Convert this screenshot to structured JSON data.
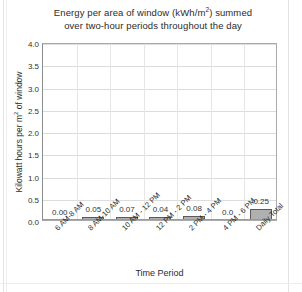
{
  "chart_data": {
    "type": "bar",
    "title_line1": "Energy per area of window (kWh/m",
    "title_sup": "2",
    "title_line1_end": ") summed",
    "title_line2": "over two-hour periods throughout the day",
    "title": "Energy per area of window (kWh/m2) summed over two-hour periods throughout the day",
    "xlabel": "Time Period",
    "ylabel_pre": "Kilowatt hours per m",
    "ylabel_sup": "2",
    "ylabel_post": " of window",
    "ylabel": "Kilowatt hours per m2 of window",
    "categories": [
      "6 AM-8 AM",
      "8 AM-10 AM",
      "10 AM - 12 PM",
      "12 PM - 2 PM",
      "2 PM - 4 PM",
      "4 PM - 6 PM",
      "Daily Total"
    ],
    "values": [
      0.0,
      0.05,
      0.07,
      0.04,
      0.08,
      0.0,
      0.25
    ],
    "value_labels": [
      "0.00",
      "0.05",
      "0.07",
      "0.04",
      "0.08",
      "0.0",
      "0.25"
    ],
    "ylim": [
      0.0,
      4.0
    ],
    "ytick_labels": [
      "0.0",
      "0.5",
      "1.0",
      "1.5",
      "2.0",
      "2.5",
      "3.0",
      "3.5",
      "4.0"
    ],
    "ytick_values": [
      0.0,
      0.5,
      1.0,
      1.5,
      2.0,
      2.5,
      3.0,
      3.5,
      4.0
    ],
    "grid": true,
    "legend": false,
    "bar_color": "#b0b0b0",
    "bar_border_color": "#5a5a5a",
    "grid_color": "#dcdcdc",
    "axis_color": "#8c8c8c",
    "background": "#ffffff"
  }
}
